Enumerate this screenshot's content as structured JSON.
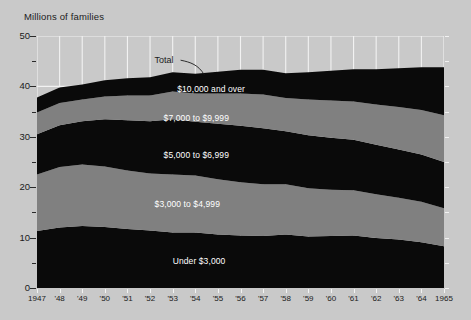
{
  "figure": {
    "axis_title": "Millions of families",
    "total_annotation": "Total",
    "background_color": "#c9c9c9",
    "grid_color": "#f2f2f2",
    "band_dark_color": "#0a0a0a",
    "band_mid_color": "#808080",
    "label_color": "#ffffff"
  },
  "chart_data": {
    "type": "area",
    "title": "",
    "subtitle": "",
    "xlabel": "",
    "ylabel": "Millions of families",
    "stacked": true,
    "grid": true,
    "legend_position": "inline-band-labels",
    "xlim": [
      1947,
      1965
    ],
    "ylim": [
      0,
      50
    ],
    "yticks": [
      0,
      10,
      20,
      30,
      40,
      50
    ],
    "yticks_minor": [
      5,
      15,
      25,
      35,
      45
    ],
    "ytick_labels": [
      "0",
      "10",
      "20",
      "30",
      "40",
      "50"
    ],
    "x": [
      1947,
      1948,
      1949,
      1950,
      1951,
      1952,
      1953,
      1954,
      1955,
      1956,
      1957,
      1958,
      1959,
      1960,
      1961,
      1962,
      1963,
      1964,
      1965
    ],
    "xtick_labels": [
      "1947",
      "'48",
      "'49",
      "'50",
      "'51",
      "'52",
      "'53",
      "'54",
      "'55",
      "'56",
      "'57",
      "'58",
      "'59",
      "'60",
      "'61",
      "'62",
      "'63",
      "'64",
      "1965"
    ],
    "series": [
      {
        "name": "Under $3,000",
        "color": "#0a0a0a",
        "values": [
          11.3,
          12.0,
          12.3,
          12.1,
          11.7,
          11.4,
          11.0,
          11.0,
          10.6,
          10.4,
          10.3,
          10.6,
          10.2,
          10.3,
          10.4,
          9.9,
          9.6,
          9.1,
          8.3
        ]
      },
      {
        "name": "$3,000 to $4,999",
        "color": "#808080",
        "values": [
          11.2,
          12.0,
          12.2,
          12.0,
          11.6,
          11.3,
          11.5,
          11.3,
          11.0,
          10.6,
          10.3,
          10.0,
          9.6,
          9.2,
          9.0,
          8.7,
          8.3,
          8.0,
          7.5
        ]
      },
      {
        "name": "$5,000 to $6,999",
        "color": "#0a0a0a",
        "values": [
          8.0,
          8.3,
          8.6,
          9.4,
          10.0,
          10.4,
          11.0,
          10.7,
          11.0,
          11.2,
          11.1,
          10.5,
          10.5,
          10.3,
          10.0,
          9.8,
          9.6,
          9.4,
          9.2
        ]
      },
      {
        "name": "$7,000 to $9,999",
        "color": "#808080",
        "values": [
          4.3,
          4.4,
          4.3,
          4.5,
          4.9,
          5.1,
          5.5,
          5.6,
          6.0,
          6.4,
          6.7,
          6.6,
          7.1,
          7.4,
          7.6,
          8.0,
          8.4,
          8.8,
          9.3
        ]
      },
      {
        "name": "$10,000 and over",
        "color": "#0a0a0a",
        "values": [
          3.0,
          3.1,
          3.0,
          3.2,
          3.4,
          3.6,
          3.8,
          3.9,
          4.3,
          4.7,
          4.9,
          4.9,
          5.4,
          5.9,
          6.4,
          7.0,
          7.7,
          8.5,
          9.5
        ]
      }
    ],
    "totals": [
      37.8,
      39.8,
      40.4,
      41.2,
      41.6,
      41.8,
      42.8,
      42.5,
      42.9,
      43.3,
      43.3,
      42.6,
      42.8,
      43.1,
      43.4,
      43.4,
      43.6,
      43.8,
      43.8
    ],
    "annotations": [
      {
        "text": "Total",
        "x": 1952.2,
        "y": 45.0,
        "note": "leader line curves down-right to the top of the stack"
      }
    ],
    "band_labels": [
      {
        "text": "$10,000 and over",
        "band": "$10,000 and over",
        "x": 1953.2,
        "y": 39.2
      },
      {
        "text": "$7,000 to $9,999",
        "band": "$7,000 to $9,999",
        "x": 1952.6,
        "y": 33.5
      },
      {
        "text": "$5,000 to $6,999",
        "band": "$5,000 to $6,999",
        "x": 1952.6,
        "y": 26.2
      },
      {
        "text": "$3,000 to $4,999",
        "band": "$3,000 to $4,999",
        "x": 1952.2,
        "y": 16.5
      },
      {
        "text": "Under $3,000",
        "band": "Under $3,000",
        "x": 1953.0,
        "y": 5.2
      }
    ]
  }
}
